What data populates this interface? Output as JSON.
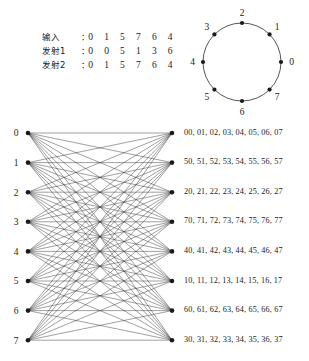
{
  "symbol_table": {
    "rows": [
      {
        "label": "输入",
        "colon": "：",
        "digits": "0 1 5 7 6 4"
      },
      {
        "label": "发射1",
        "colon": "：",
        "digits": "0 0 5 1 3 6"
      },
      {
        "label": "发射2",
        "colon": "：",
        "digits": "0 1 5 7 6 4"
      }
    ]
  },
  "constellation": {
    "type": "8psk",
    "points": [
      {
        "label": "0",
        "angle_deg": 0
      },
      {
        "label": "1",
        "angle_deg": 45
      },
      {
        "label": "2",
        "angle_deg": 90
      },
      {
        "label": "3",
        "angle_deg": 135
      },
      {
        "label": "4",
        "angle_deg": 180
      },
      {
        "label": "5",
        "angle_deg": 225
      },
      {
        "label": "6",
        "angle_deg": 270
      },
      {
        "label": "7",
        "angle_deg": 315
      }
    ]
  },
  "trellis": {
    "left_labels": [
      "0",
      "1",
      "2",
      "3",
      "4",
      "5",
      "6",
      "7"
    ],
    "node_count": 8,
    "fully_connected": true,
    "edge_count": 64
  },
  "transitions": {
    "rows": [
      "00, 01, 02, 03, 04, 05, 06, 07",
      "50, 51, 52, 53, 54, 55, 56, 57",
      "20, 21, 22, 23, 24, 25, 26, 27",
      "70, 71, 72, 73, 74, 75, 76, 77",
      "40, 41, 42, 43, 44, 45, 46, 47",
      "10, 11, 12, 13, 14, 15, 16, 17",
      "60, 61, 62, 63, 64, 65, 66, 67",
      "30, 31, 32, 33, 34, 35, 36, 37"
    ]
  },
  "colors": {
    "ink": "#1a1a1a",
    "line": "#2b2b2b",
    "background": "#ffffff"
  }
}
